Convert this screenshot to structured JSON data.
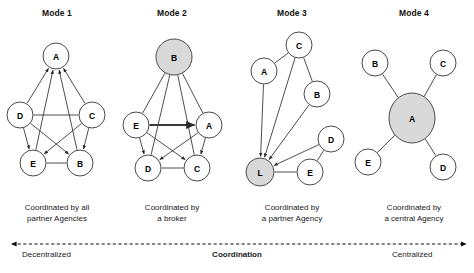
{
  "figure": {
    "width": 474,
    "height": 273,
    "background": "#ffffff",
    "node_fill_plain": "#ffffff",
    "node_fill_highlight": "#d9d9d9",
    "edge_color": "#3a3a3a",
    "node_stroke": "#4a4a4a"
  },
  "modes": [
    {
      "title": "Mode 1",
      "title_x": 57,
      "caption_line1": "Coordinated by all",
      "caption_line2": "partner Agencies",
      "caption_x": 57,
      "nodes": [
        {
          "label": "A",
          "x": 56,
          "y": 56,
          "rx": 13,
          "ry": 13,
          "highlight": false
        },
        {
          "label": "D",
          "x": 20,
          "y": 115,
          "rx": 13,
          "ry": 13,
          "highlight": false
        },
        {
          "label": "C",
          "x": 92,
          "y": 115,
          "rx": 13,
          "ry": 13,
          "highlight": false
        },
        {
          "label": "E",
          "x": 33,
          "y": 163,
          "rx": 13,
          "ry": 13,
          "highlight": false
        },
        {
          "label": "B",
          "x": 80,
          "y": 163,
          "rx": 13,
          "ry": 13,
          "highlight": false
        }
      ],
      "edges": [
        {
          "from": "D",
          "to": "A",
          "arrow": true
        },
        {
          "from": "C",
          "to": "A",
          "arrow": true
        },
        {
          "from": "E",
          "to": "A",
          "arrow": true
        },
        {
          "from": "B",
          "to": "A",
          "arrow": true
        },
        {
          "from": "D",
          "to": "C",
          "arrow": false
        },
        {
          "from": "D",
          "to": "E",
          "arrow": true
        },
        {
          "from": "D",
          "to": "B",
          "arrow": true
        },
        {
          "from": "C",
          "to": "E",
          "arrow": true
        },
        {
          "from": "C",
          "to": "B",
          "arrow": true
        },
        {
          "from": "E",
          "to": "B",
          "arrow": false
        }
      ]
    },
    {
      "title": "Mode 2",
      "title_x": 172,
      "caption_line1": "Coordinated by",
      "caption_line2": "a broker",
      "caption_x": 172,
      "nodes": [
        {
          "label": "B",
          "x": 174,
          "y": 57,
          "rx": 18,
          "ry": 18,
          "highlight": true
        },
        {
          "label": "E",
          "x": 136,
          "y": 125,
          "rx": 13,
          "ry": 13,
          "highlight": false
        },
        {
          "label": "A",
          "x": 209,
          "y": 125,
          "rx": 13,
          "ry": 13,
          "highlight": false
        },
        {
          "label": "D",
          "x": 148,
          "y": 168,
          "rx": 13,
          "ry": 13,
          "highlight": false
        },
        {
          "label": "C",
          "x": 197,
          "y": 168,
          "rx": 13,
          "ry": 13,
          "highlight": false
        }
      ],
      "edges": [
        {
          "from": "E",
          "to": "B",
          "arrow": false
        },
        {
          "from": "A",
          "to": "B",
          "arrow": false
        },
        {
          "from": "D",
          "to": "B",
          "arrow": false
        },
        {
          "from": "C",
          "to": "B",
          "arrow": false
        },
        {
          "from": "E",
          "to": "A",
          "arrow": true,
          "thick": true
        },
        {
          "from": "E",
          "to": "D",
          "arrow": true
        },
        {
          "from": "E",
          "to": "C",
          "arrow": true
        },
        {
          "from": "A",
          "to": "D",
          "arrow": true
        },
        {
          "from": "A",
          "to": "C",
          "arrow": true
        },
        {
          "from": "D",
          "to": "C",
          "arrow": false
        }
      ]
    },
    {
      "title": "Mode 3",
      "title_x": 292,
      "caption_line1": "Coordinated by",
      "caption_line2": "a partner Agency",
      "caption_x": 292,
      "nodes": [
        {
          "label": "C",
          "x": 299,
          "y": 45,
          "rx": 13,
          "ry": 13,
          "highlight": false
        },
        {
          "label": "A",
          "x": 264,
          "y": 71,
          "rx": 13,
          "ry": 13,
          "highlight": false
        },
        {
          "label": "B",
          "x": 317,
          "y": 94,
          "rx": 13,
          "ry": 13,
          "highlight": false
        },
        {
          "label": "D",
          "x": 331,
          "y": 139,
          "rx": 13,
          "ry": 13,
          "highlight": false
        },
        {
          "label": "E",
          "x": 310,
          "y": 172,
          "rx": 13,
          "ry": 13,
          "highlight": false
        },
        {
          "label": "L",
          "x": 260,
          "y": 172,
          "rx": 14,
          "ry": 14,
          "highlight": true
        }
      ],
      "edges": [
        {
          "from": "A",
          "to": "C",
          "arrow": false
        },
        {
          "from": "C",
          "to": "B",
          "arrow": false
        },
        {
          "from": "A",
          "to": "L",
          "arrow": true
        },
        {
          "from": "C",
          "to": "L",
          "arrow": true
        },
        {
          "from": "B",
          "to": "L",
          "arrow": true
        },
        {
          "from": "D",
          "to": "L",
          "arrow": true
        },
        {
          "from": "D",
          "to": "E",
          "arrow": false
        },
        {
          "from": "E",
          "to": "L",
          "arrow": false
        }
      ]
    },
    {
      "title": "Mode 4",
      "title_x": 414,
      "caption_line1": "Coordinated by",
      "caption_line2": "a central Agency",
      "caption_x": 414,
      "nodes": [
        {
          "label": "A",
          "x": 412,
          "y": 118,
          "rx": 23,
          "ry": 25,
          "highlight": true
        },
        {
          "label": "B",
          "x": 375,
          "y": 63,
          "rx": 13,
          "ry": 13,
          "highlight": false
        },
        {
          "label": "C",
          "x": 443,
          "y": 63,
          "rx": 13,
          "ry": 13,
          "highlight": false
        },
        {
          "label": "E",
          "x": 368,
          "y": 162,
          "rx": 13,
          "ry": 13,
          "highlight": false
        },
        {
          "label": "D",
          "x": 443,
          "y": 167,
          "rx": 13,
          "ry": 13,
          "highlight": false
        }
      ],
      "edges": [
        {
          "from": "B",
          "to": "A",
          "arrow": false
        },
        {
          "from": "C",
          "to": "A",
          "arrow": false
        },
        {
          "from": "E",
          "to": "A",
          "arrow": false
        },
        {
          "from": "D",
          "to": "A",
          "arrow": false
        }
      ]
    }
  ],
  "axis": {
    "left_label": "Decentralized",
    "center_label": "Coordination",
    "right_label": "Centralized",
    "left_label_x": 22,
    "center_label_x": 237,
    "right_label_x": 392,
    "label_y": 250,
    "line_y": 244,
    "line_x1": 12,
    "line_x2": 466,
    "style": "dashed double-headed arrow"
  }
}
